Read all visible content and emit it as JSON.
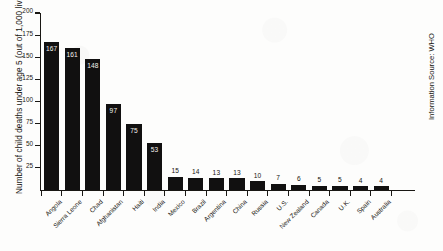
{
  "chart_data": {
    "type": "bar",
    "title": "",
    "xlabel": "",
    "ylabel": "Number of child deaths under age 5 (out of 1,000 live births)",
    "ylim": [
      0,
      200
    ],
    "yticks": [
      25,
      50,
      75,
      100,
      125,
      150,
      175,
      200
    ],
    "grid": false,
    "legend": "none",
    "orientation": "vertical",
    "bar_color": "#111010",
    "categories": [
      "Angola",
      "Sierra Leone",
      "Chad",
      "Afghanistan",
      "Haiti",
      "India",
      "Mexico",
      "Brazil",
      "Argentina",
      "China",
      "Russia",
      "U.S.",
      "New Zealand",
      "Canada",
      "U.K.",
      "Spain",
      "Australia"
    ],
    "values": [
      167,
      161,
      148,
      97,
      75,
      53,
      15,
      14,
      13,
      13,
      10,
      7,
      6,
      5,
      5,
      4,
      4
    ],
    "annotations": {
      "source": "Information Source: WHO"
    }
  }
}
